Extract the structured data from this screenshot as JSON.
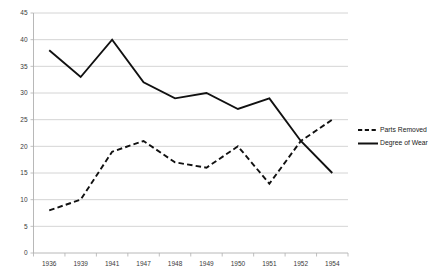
{
  "chart_data": {
    "type": "line",
    "title": "",
    "xlabel": "",
    "ylabel": "",
    "categories": [
      "1936",
      "1939",
      "1941",
      "1947",
      "1948",
      "1949",
      "1950",
      "1951",
      "1952",
      "1954"
    ],
    "series": [
      {
        "name": "Parts Removed",
        "style": "dashed",
        "color": "#111111",
        "values": [
          8,
          10,
          19,
          21,
          17,
          16,
          20,
          13,
          21,
          25
        ]
      },
      {
        "name": "Degree of Wear",
        "style": "solid",
        "color": "#111111",
        "values": [
          38,
          33,
          40,
          32,
          29,
          30,
          27,
          29,
          21,
          15
        ]
      }
    ],
    "ylim": [
      0,
      45
    ],
    "yticks": [
      0,
      5,
      10,
      15,
      20,
      25,
      30,
      35,
      40,
      45
    ],
    "ytick_labels": [
      "0",
      "5",
      "10",
      "15",
      "20",
      "25",
      "30",
      "35",
      "40",
      "45"
    ],
    "grid": true,
    "grid_axis": "y",
    "legend_position": "right",
    "legend": [
      {
        "label": "Parts Removed",
        "style": "dashed"
      },
      {
        "label": "Degree of Wear",
        "style": "solid"
      }
    ]
  },
  "colors": {
    "background": "#ffffff",
    "grid": "#c9c9c9",
    "axis": "#b0b0b0",
    "line": "#111111",
    "tick_text": "#3a3a3a",
    "legend_text": "#1a1a1a"
  }
}
